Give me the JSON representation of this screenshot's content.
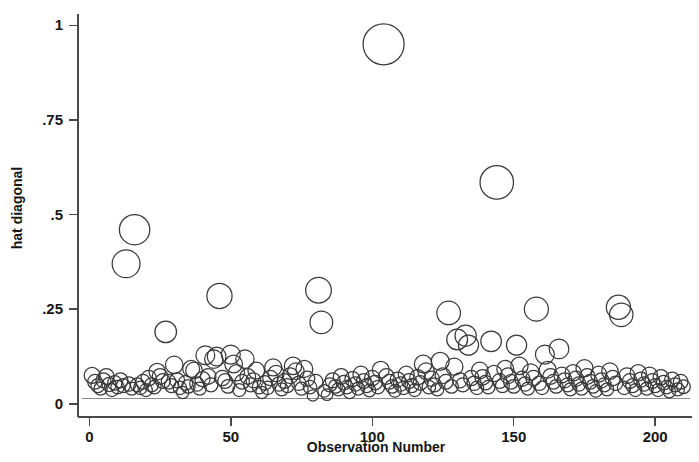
{
  "chart_data": {
    "type": "scatter",
    "title": "",
    "xlabel": "Observation Number",
    "ylabel": "hat diagonal",
    "xlim": [
      -4,
      213
    ],
    "ylim": [
      -0.035,
      1.03
    ],
    "xticks": [
      0,
      50,
      100,
      150,
      200
    ],
    "xtick_labels": [
      "0",
      "50",
      "100",
      "150",
      "200"
    ],
    "yticks": [
      0,
      0.25,
      0.5,
      0.75,
      1
    ],
    "ytick_labels": [
      "0",
      ".25",
      ".5",
      ".75",
      "1"
    ],
    "grid": false,
    "legend": null,
    "marker": "open-circle",
    "marker_size_encodes": "hat diagonal value",
    "reference_line": {
      "orientation": "horizontal",
      "y": 0.014,
      "color": "#8a8a8a"
    },
    "series": [
      {
        "name": "hat diagonal",
        "color": "#3a3a3a",
        "points": [
          [
            1,
            0.075
          ],
          [
            2,
            0.058
          ],
          [
            3,
            0.048
          ],
          [
            4,
            0.04
          ],
          [
            5,
            0.062
          ],
          [
            6,
            0.072
          ],
          [
            7,
            0.051
          ],
          [
            8,
            0.036
          ],
          [
            9,
            0.055
          ],
          [
            10,
            0.044
          ],
          [
            11,
            0.062
          ],
          [
            12,
            0.048
          ],
          [
            13,
            0.37
          ],
          [
            14,
            0.052
          ],
          [
            15,
            0.04
          ],
          [
            16,
            0.46
          ],
          [
            17,
            0.05
          ],
          [
            18,
            0.042
          ],
          [
            19,
            0.058
          ],
          [
            20,
            0.036
          ],
          [
            21,
            0.068
          ],
          [
            22,
            0.05
          ],
          [
            23,
            0.044
          ],
          [
            24,
            0.085
          ],
          [
            25,
            0.072
          ],
          [
            26,
            0.06
          ],
          [
            27,
            0.19
          ],
          [
            28,
            0.058
          ],
          [
            29,
            0.048
          ],
          [
            30,
            0.103
          ],
          [
            31,
            0.062
          ],
          [
            32,
            0.042
          ],
          [
            33,
            0.03
          ],
          [
            34,
            0.055
          ],
          [
            35,
            0.046
          ],
          [
            36,
            0.092
          ],
          [
            37,
            0.088
          ],
          [
            38,
            0.052
          ],
          [
            39,
            0.04
          ],
          [
            40,
            0.065
          ],
          [
            41,
            0.128
          ],
          [
            42,
            0.072
          ],
          [
            43,
            0.05
          ],
          [
            44,
            0.118
          ],
          [
            45,
            0.125
          ],
          [
            46,
            0.285
          ],
          [
            47,
            0.068
          ],
          [
            48,
            0.06
          ],
          [
            49,
            0.046
          ],
          [
            50,
            0.13
          ],
          [
            51,
            0.105
          ],
          [
            52,
            0.082
          ],
          [
            53,
            0.036
          ],
          [
            54,
            0.058
          ],
          [
            55,
            0.118
          ],
          [
            56,
            0.072
          ],
          [
            57,
            0.05
          ],
          [
            58,
            0.062
          ],
          [
            59,
            0.088
          ],
          [
            60,
            0.044
          ],
          [
            61,
            0.03
          ],
          [
            62,
            0.055
          ],
          [
            63,
            0.042
          ],
          [
            64,
            0.068
          ],
          [
            65,
            0.096
          ],
          [
            66,
            0.08
          ],
          [
            67,
            0.052
          ],
          [
            68,
            0.038
          ],
          [
            69,
            0.06
          ],
          [
            70,
            0.048
          ],
          [
            71,
            0.074
          ],
          [
            72,
            0.1
          ],
          [
            73,
            0.086
          ],
          [
            74,
            0.054
          ],
          [
            75,
            0.04
          ],
          [
            76,
            0.092
          ],
          [
            77,
            0.066
          ],
          [
            78,
            0.044
          ],
          [
            79,
            0.022
          ],
          [
            80,
            0.058
          ],
          [
            81,
            0.3
          ],
          [
            82,
            0.215
          ],
          [
            83,
            0.034
          ],
          [
            84,
            0.024
          ],
          [
            85,
            0.05
          ],
          [
            86,
            0.062
          ],
          [
            87,
            0.046
          ],
          [
            88,
            0.038
          ],
          [
            89,
            0.072
          ],
          [
            90,
            0.056
          ],
          [
            91,
            0.044
          ],
          [
            92,
            0.03
          ],
          [
            93,
            0.065
          ],
          [
            94,
            0.052
          ],
          [
            95,
            0.04
          ],
          [
            96,
            0.078
          ],
          [
            97,
            0.06
          ],
          [
            98,
            0.048
          ],
          [
            99,
            0.035
          ],
          [
            100,
            0.068
          ],
          [
            101,
            0.056
          ],
          [
            102,
            0.044
          ],
          [
            103,
            0.09
          ],
          [
            104,
            0.95
          ],
          [
            105,
            0.072
          ],
          [
            106,
            0.058
          ],
          [
            107,
            0.046
          ],
          [
            108,
            0.034
          ],
          [
            109,
            0.064
          ],
          [
            110,
            0.052
          ],
          [
            111,
            0.042
          ],
          [
            112,
            0.078
          ],
          [
            113,
            0.06
          ],
          [
            114,
            0.048
          ],
          [
            115,
            0.036
          ],
          [
            116,
            0.07
          ],
          [
            117,
            0.055
          ],
          [
            118,
            0.105
          ],
          [
            119,
            0.086
          ],
          [
            120,
            0.044
          ],
          [
            121,
            0.066
          ],
          [
            122,
            0.05
          ],
          [
            123,
            0.038
          ],
          [
            124,
            0.112
          ],
          [
            125,
            0.074
          ],
          [
            126,
            0.058
          ],
          [
            127,
            0.24
          ],
          [
            128,
            0.046
          ],
          [
            129,
            0.098
          ],
          [
            130,
            0.17
          ],
          [
            131,
            0.062
          ],
          [
            132,
            0.05
          ],
          [
            133,
            0.18
          ],
          [
            134,
            0.155
          ],
          [
            135,
            0.068
          ],
          [
            136,
            0.054
          ],
          [
            137,
            0.042
          ],
          [
            138,
            0.088
          ],
          [
            139,
            0.07
          ],
          [
            140,
            0.056
          ],
          [
            141,
            0.044
          ],
          [
            142,
            0.165
          ],
          [
            143,
            0.08
          ],
          [
            144,
            0.585
          ],
          [
            145,
            0.06
          ],
          [
            146,
            0.048
          ],
          [
            147,
            0.092
          ],
          [
            148,
            0.074
          ],
          [
            149,
            0.058
          ],
          [
            150,
            0.046
          ],
          [
            151,
            0.155
          ],
          [
            152,
            0.1
          ],
          [
            153,
            0.066
          ],
          [
            154,
            0.052
          ],
          [
            155,
            0.04
          ],
          [
            156,
            0.084
          ],
          [
            157,
            0.068
          ],
          [
            158,
            0.25
          ],
          [
            159,
            0.054
          ],
          [
            160,
            0.042
          ],
          [
            161,
            0.13
          ],
          [
            162,
            0.09
          ],
          [
            163,
            0.072
          ],
          [
            164,
            0.058
          ],
          [
            165,
            0.046
          ],
          [
            166,
            0.145
          ],
          [
            167,
            0.076
          ],
          [
            168,
            0.062
          ],
          [
            169,
            0.05
          ],
          [
            170,
            0.038
          ],
          [
            171,
            0.082
          ],
          [
            172,
            0.066
          ],
          [
            173,
            0.052
          ],
          [
            174,
            0.04
          ],
          [
            175,
            0.094
          ],
          [
            176,
            0.072
          ],
          [
            177,
            0.058
          ],
          [
            178,
            0.046
          ],
          [
            179,
            0.034
          ],
          [
            180,
            0.078
          ],
          [
            181,
            0.062
          ],
          [
            182,
            0.05
          ],
          [
            183,
            0.038
          ],
          [
            184,
            0.086
          ],
          [
            185,
            0.068
          ],
          [
            186,
            0.054
          ],
          [
            187,
            0.255
          ],
          [
            188,
            0.235
          ],
          [
            189,
            0.042
          ],
          [
            190,
            0.074
          ],
          [
            191,
            0.06
          ],
          [
            192,
            0.048
          ],
          [
            193,
            0.036
          ],
          [
            194,
            0.082
          ],
          [
            195,
            0.064
          ],
          [
            196,
            0.052
          ],
          [
            197,
            0.04
          ],
          [
            198,
            0.076
          ],
          [
            199,
            0.06
          ],
          [
            200,
            0.048
          ],
          [
            201,
            0.036
          ],
          [
            202,
            0.07
          ],
          [
            203,
            0.056
          ],
          [
            204,
            0.044
          ],
          [
            205,
            0.032
          ],
          [
            206,
            0.064
          ],
          [
            207,
            0.05
          ],
          [
            208,
            0.038
          ],
          [
            209,
            0.058
          ],
          [
            210,
            0.045
          ]
        ]
      }
    ]
  }
}
